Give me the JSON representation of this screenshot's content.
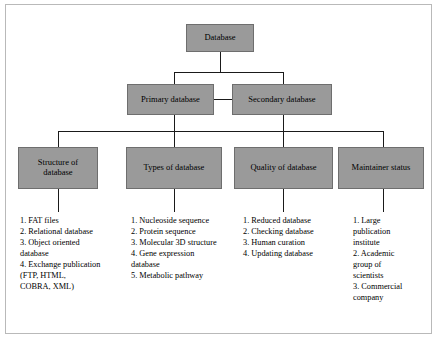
{
  "diagram": {
    "title_box": {
      "label": "Database"
    },
    "level2": [
      {
        "name": "primary-database",
        "label": "Primary database"
      },
      {
        "name": "secondary-database",
        "label": "Secondary database"
      }
    ],
    "level3": [
      {
        "name": "structure-of-database",
        "label": "Structure of\ndatabase"
      },
      {
        "name": "types-of-database",
        "label": "Types of database"
      },
      {
        "name": "quality-of-database",
        "label": "Quality of database"
      },
      {
        "name": "maintainer-status",
        "label": "Maintainer status"
      }
    ],
    "lists": [
      {
        "name": "structure-of-database-list",
        "text": "1. FAT files\n2. Relational database\n3. Object oriented\n    database\n4. Exchange publication\n    (FTP, HTML,\n    COBRA, XML)"
      },
      {
        "name": "types-of-database-list",
        "text": "1. Nucleoside sequence\n2. Protein sequence\n3. Molecular 3D structure\n4. Gene expression\n    database\n5. Metabolic pathway"
      },
      {
        "name": "quality-of-database-list",
        "text": "1. Reduced database\n2. Checking database\n3. Human curation\n4. Updating database"
      },
      {
        "name": "maintainer-status-list",
        "text": "1. Large\n    publication\n    institute\n2. Academic\n    group of\n    scientists\n3. Commercial\n    company"
      }
    ],
    "colors": {
      "box_fill": "#9a9a9a",
      "box_border": "#6e6e6e",
      "line": "#1a1a1a",
      "text": "#000000"
    }
  }
}
